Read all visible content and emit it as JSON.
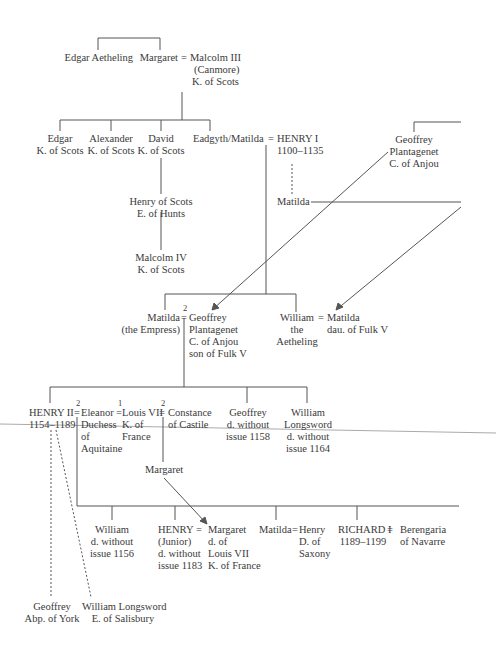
{
  "people": {
    "edgar_aetheling": [
      "Edgar Aetheling"
    ],
    "margaret": [
      "Margaret"
    ],
    "malcolm_iii": [
      "Malcolm III",
      "(Canmore)",
      "K. of Scots"
    ],
    "edgar_k": [
      "Edgar",
      "K. of Scots"
    ],
    "alexander": [
      "Alexander",
      "K. of Scots"
    ],
    "david": [
      "David",
      "K. of Scots"
    ],
    "eadgyth": [
      "Eadgyth/Matilda"
    ],
    "henry_i": [
      "HENRY I",
      "1100–1135"
    ],
    "geoffrey_top": [
      "Geoffrey",
      "Plantagenet",
      "C. of Anjou"
    ],
    "matilda_ill": [
      "Matilda"
    ],
    "henry_scots": [
      "Henry of Scots",
      "E. of Hunts"
    ],
    "malcolm_iv": [
      "Malcolm IV",
      "K. of Scots"
    ],
    "matilda_empress": [
      "Matilda",
      "(the Empress)"
    ],
    "geoffrey_plant": [
      "Geoffrey",
      "Plantagenet",
      "C. of Anjou",
      "son of Fulk V"
    ],
    "william_aeth": [
      "William",
      "the",
      "Aetheling"
    ],
    "matilda_fulk": [
      "Matilda",
      "dau. of Fulk V"
    ],
    "henry_ii": [
      "HENRY II",
      "1154–1189"
    ],
    "eleanor": [
      "Eleanor",
      "Duchess",
      "of",
      "Aquitaine"
    ],
    "louis_vii": [
      "Louis VII",
      "K. of",
      "France"
    ],
    "constance": [
      "Constance",
      "of Castile"
    ],
    "geoffrey_d": [
      "Geoffrey",
      "d. without",
      "issue 1158"
    ],
    "william_long_a": [
      "William",
      "Longsword",
      "d. without",
      "issue 1164"
    ],
    "margaret_b": [
      "Margaret"
    ],
    "william_d": [
      "William",
      "d. without",
      "issue 1156"
    ],
    "henry_jr": [
      "HENRY",
      "(Junior)",
      "d. without",
      "issue 1183"
    ],
    "margaret_fr": [
      "Margaret",
      "d. of",
      "Louis VII",
      "K. of France"
    ],
    "matilda_sax": [
      "Matilda"
    ],
    "henry_sax": [
      "Henry",
      "D. of",
      "Saxony"
    ],
    "richard_i": [
      "RICHARD I",
      "1189–1199"
    ],
    "berengaria": [
      "Berengaria",
      "of Navarre"
    ],
    "geoffrey_york": [
      "Geoffrey",
      "Abp. of York"
    ],
    "william_salis": [
      "William Longsword",
      "E. of Salisbury"
    ]
  },
  "marks": {
    "eq": "=",
    "marriage_2": "2",
    "marriage_1": "1"
  }
}
